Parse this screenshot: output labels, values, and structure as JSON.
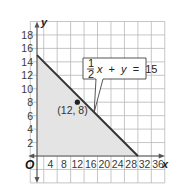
{
  "chart_data": {
    "type": "line",
    "title": "",
    "xlabel": "x",
    "ylabel": "y",
    "origin_label": "O",
    "xlim": [
      -6,
      38
    ],
    "ylim": [
      -4,
      20
    ],
    "x_ticks": [
      4,
      8,
      12,
      16,
      20,
      24,
      28,
      32,
      36
    ],
    "x_tick_labels": [
      "4",
      "8",
      "12",
      "16",
      "20",
      "24",
      "28",
      "32",
      "36"
    ],
    "y_ticks": [
      2,
      4,
      6,
      8,
      10,
      12,
      14,
      16,
      18
    ],
    "y_tick_labels": [
      "2",
      "4",
      "6",
      "8",
      "10",
      "12",
      "14",
      "16",
      "18"
    ],
    "grid": true,
    "grid_step": {
      "x": 4,
      "y": 2
    },
    "series": [
      {
        "name": "1/2 x + y = 15",
        "kind": "boundary-line",
        "x": [
          0,
          30
        ],
        "y": [
          15,
          0
        ],
        "color": "#333333"
      }
    ],
    "shaded_region": {
      "description": "Region below the line in the first quadrant",
      "vertices": [
        [
          0,
          0
        ],
        [
          0,
          15
        ],
        [
          30,
          0
        ]
      ],
      "color": "#e4e4e4"
    },
    "points": [
      {
        "x": 12,
        "y": 8,
        "label": "(12, 8)"
      }
    ],
    "annotations": [
      {
        "text": "1/2 x + y = 15",
        "fraction": {
          "numerator": "1",
          "denominator": "2"
        },
        "variable1": "x",
        "operator1": "+",
        "variable2": "y",
        "equals": "=",
        "constant": "15",
        "points_to": [
          17,
          6.5
        ]
      }
    ]
  },
  "colors": {
    "grid": "#b8b8b8",
    "axis": "#555555",
    "line": "#333333",
    "shade": "#e4e4e4",
    "point": "#222222",
    "callout_border": "#444444",
    "callout_bg": "#ffffff"
  }
}
